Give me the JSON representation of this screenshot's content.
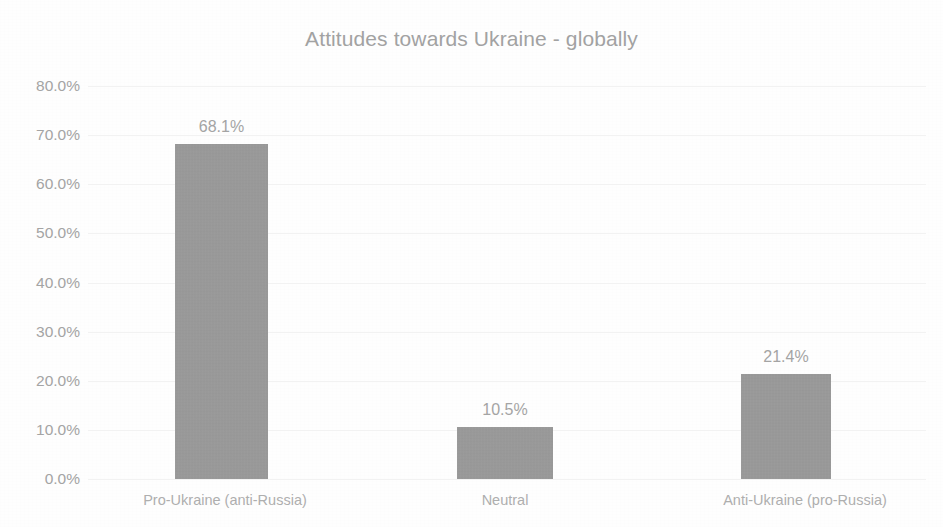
{
  "chart_data": {
    "type": "bar",
    "title": "Attitudes towards Ukraine - globally",
    "xlabel": "",
    "ylabel": "",
    "categories": [
      "Pro-Ukraine (anti-Russia)",
      "Neutral",
      "Anti-Ukraine (pro-Russia)"
    ],
    "values": [
      68.1,
      10.5,
      21.4
    ],
    "value_labels": [
      "68.1%",
      "10.5%",
      "21.4%"
    ],
    "ylim": [
      0,
      80
    ],
    "ytick_values": [
      0,
      10,
      20,
      30,
      40,
      50,
      60,
      70,
      80
    ],
    "ytick_labels": [
      "0.0%",
      "10.0%",
      "20.0%",
      "30.0%",
      "40.0%",
      "50.0%",
      "60.0%",
      "70.0%",
      "80.0%"
    ],
    "grid": true,
    "grid_axis": "y",
    "legend": false,
    "legend_position": "none",
    "bar_color": "#9b9b9b",
    "text_color": "#a4a4a4",
    "title_color": "#a2a2a2",
    "gridline_color": "#f2f2f2",
    "background_color": "#fefefe"
  }
}
